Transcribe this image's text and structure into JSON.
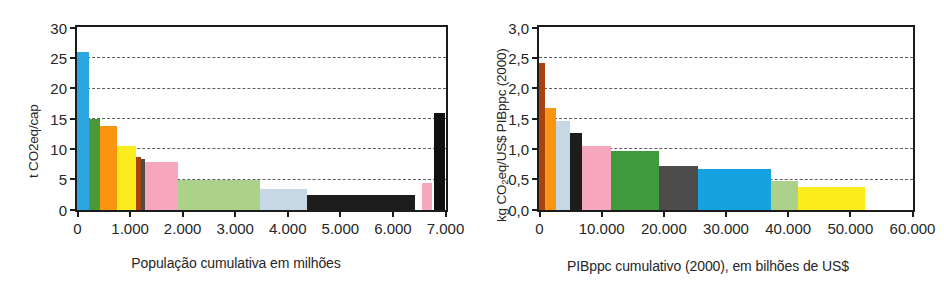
{
  "chart_data": [
    {
      "id": "left",
      "type": "bar",
      "title": "",
      "xlabel": "População cumulativa em milhões",
      "ylabel": "t CO2eq/cap",
      "ylabel_plain": "t CO2eq/cap",
      "xlim": [
        0,
        7000
      ],
      "ylim": [
        0,
        30
      ],
      "yticks": [
        0,
        5,
        10,
        15,
        20,
        25,
        30
      ],
      "ytick_labels": [
        "0",
        "5",
        "10",
        "15",
        "20",
        "25",
        "30"
      ],
      "xticks": [
        0,
        1000,
        2000,
        3000,
        4000,
        5000,
        6000,
        7000
      ],
      "xtick_labels": [
        "0",
        "1.000",
        "2.000",
        "3.000",
        "4.000",
        "5.000",
        "6.000",
        "7.000"
      ],
      "grid": true,
      "grid_values": [
        5,
        10,
        15,
        20,
        25
      ],
      "legend": "none",
      "note": "Width of each bar = cumulative population span; height = per-capita emissions",
      "bars": [
        {
          "x_start": 0,
          "x_end": 230,
          "value": 26.0,
          "color": "#2ba6e0"
        },
        {
          "x_start": 230,
          "x_end": 440,
          "value": 15.0,
          "color": "#4a9b38"
        },
        {
          "x_start": 440,
          "x_end": 760,
          "value": 13.8,
          "color": "#fa9512"
        },
        {
          "x_start": 760,
          "x_end": 1130,
          "value": 10.5,
          "color": "#fbed1c"
        },
        {
          "x_start": 1130,
          "x_end": 1215,
          "value": 8.7,
          "color": "#a8420f"
        },
        {
          "x_start": 1215,
          "x_end": 1300,
          "value": 8.4,
          "color": "#4c4c4c"
        },
        {
          "x_start": 1300,
          "x_end": 1930,
          "value": 7.9,
          "color": "#f7a7bd"
        },
        {
          "x_start": 1930,
          "x_end": 3480,
          "value": 5.0,
          "color": "#abd18b"
        },
        {
          "x_start": 3480,
          "x_end": 4370,
          "value": 3.5,
          "color": "#c5d8e4"
        },
        {
          "x_start": 4370,
          "x_end": 6430,
          "value": 2.5,
          "color": "#1d1d1d"
        },
        {
          "x_start": 6570,
          "x_end": 6760,
          "value": 4.4,
          "color": "#f7a7bd"
        },
        {
          "x_start": 6800,
          "x_end": 7000,
          "value": 16.0,
          "color": "#101010"
        }
      ]
    },
    {
      "id": "right",
      "type": "bar",
      "title": "",
      "xlabel": "PIBppc cumulativo (2000), em bilhões de US$",
      "ylabel": "kg CO2eq/US$ PIBppc (2000)",
      "ylabel_prefix": "kg CO",
      "ylabel_sub": "2",
      "ylabel_suffix": "eq/US$ PIBppc (2000)",
      "xlim": [
        0,
        60000
      ],
      "ylim": [
        0,
        3.0
      ],
      "yticks": [
        0,
        0.5,
        1.0,
        1.5,
        2.0,
        2.5,
        3.0
      ],
      "ytick_labels": [
        "0,0",
        "0,5",
        "1,0",
        "1,5",
        "2,0",
        "2,5",
        "3,0"
      ],
      "xticks": [
        0,
        10000,
        20000,
        30000,
        40000,
        50000,
        60000
      ],
      "xtick_labels": [
        "0",
        "10.000",
        "20.000",
        "30.000",
        "40.000",
        "50.000",
        "60.000"
      ],
      "grid": true,
      "grid_values": [
        0.5,
        1.0,
        1.5,
        2.0,
        2.5
      ],
      "legend": "none",
      "note": "Width of each bar = cumulative GDPppp span; height = emission intensity",
      "bars": [
        {
          "x_start": 0,
          "x_end": 900,
          "value": 2.42,
          "color": "#a8420f"
        },
        {
          "x_start": 900,
          "x_end": 2700,
          "value": 1.68,
          "color": "#fa9512"
        },
        {
          "x_start": 2700,
          "x_end": 5000,
          "value": 1.47,
          "color": "#c5d8e4"
        },
        {
          "x_start": 5000,
          "x_end": 6900,
          "value": 1.27,
          "color": "#1d1d1d"
        },
        {
          "x_start": 6900,
          "x_end": 11600,
          "value": 1.05,
          "color": "#f7a7bd"
        },
        {
          "x_start": 11600,
          "x_end": 19300,
          "value": 0.97,
          "color": "#3f9a3c"
        },
        {
          "x_start": 19300,
          "x_end": 25600,
          "value": 0.73,
          "color": "#4c4c4c"
        },
        {
          "x_start": 25600,
          "x_end": 37300,
          "value": 0.68,
          "color": "#16a2e0"
        },
        {
          "x_start": 37300,
          "x_end": 41600,
          "value": 0.48,
          "color": "#abd18b"
        },
        {
          "x_start": 41600,
          "x_end": 52400,
          "value": 0.38,
          "color": "#fbed1c"
        }
      ]
    }
  ]
}
